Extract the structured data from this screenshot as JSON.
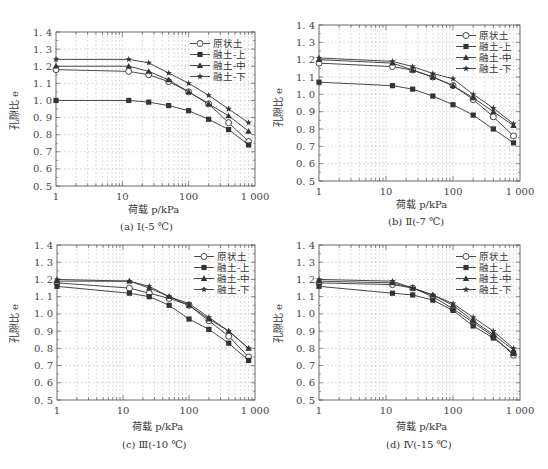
{
  "figure": {
    "panels": [
      {
        "id": "a",
        "caption": "(a) Ⅰ(-5 ℃)",
        "xlabel": "荷载 p/kPa",
        "ylabel": "孔隙比 e"
      },
      {
        "id": "b",
        "caption": "(b) Ⅱ(-7 ℃)",
        "xlabel": "荷载 p/kPa",
        "ylabel": "孔隙比 e"
      },
      {
        "id": "c",
        "caption": "(c) Ⅲ(-10 ℃)",
        "xlabel": "荷载 p/kPa",
        "ylabel": "孔隙比 e"
      },
      {
        "id": "d",
        "caption": "(d) Ⅳ(-15 ℃)",
        "xlabel": "荷载 p/kPa",
        "ylabel": "孔隙比 e"
      }
    ],
    "legend": [
      {
        "label": "原状土",
        "marker": "circle-open"
      },
      {
        "label": "融土-上",
        "marker": "square-filled"
      },
      {
        "label": "融土-中",
        "marker": "triangle-filled"
      },
      {
        "label": "融土-下",
        "marker": "star-filled"
      }
    ],
    "colors": {
      "line": "#333333",
      "grid": "#bbbbbb",
      "axis": "#444444"
    }
  },
  "chart_data": [
    {
      "type": "line",
      "title": "(a) Ⅰ(-5 ℃)",
      "xlabel": "荷载 p/kPa",
      "ylabel": "孔隙比 e",
      "xscale": "log",
      "xlim": [
        1,
        1000
      ],
      "ylim": [
        0.5,
        1.4
      ],
      "xticks": [
        "1",
        "10",
        "100",
        "1 000"
      ],
      "yticks": [
        "0.5",
        "0.6",
        "0.7",
        "0.8",
        "0.9",
        "1.0",
        "1.1",
        "1.2",
        "1.3",
        "1.4"
      ],
      "grid": true,
      "legend_position": "upper right",
      "x": [
        1,
        12.5,
        25,
        50,
        100,
        200,
        400,
        800
      ],
      "series": [
        {
          "name": "原状土",
          "values": [
            1.18,
            1.17,
            1.15,
            1.11,
            1.05,
            0.98,
            0.87,
            0.76
          ]
        },
        {
          "name": "融土-上",
          "values": [
            1.0,
            1.0,
            0.99,
            0.97,
            0.94,
            0.89,
            0.83,
            0.74
          ]
        },
        {
          "name": "融土-中",
          "values": [
            1.2,
            1.2,
            1.17,
            1.12,
            1.05,
            0.98,
            0.91,
            0.82
          ]
        },
        {
          "name": "融土-下",
          "values": [
            1.24,
            1.24,
            1.22,
            1.16,
            1.1,
            1.03,
            0.95,
            0.87
          ]
        }
      ]
    },
    {
      "type": "line",
      "title": "(b) Ⅱ(-7 ℃)",
      "xlabel": "荷载 p/kPa",
      "ylabel": "孔隙比 e",
      "xscale": "log",
      "xlim": [
        1,
        1000
      ],
      "ylim": [
        0.5,
        1.4
      ],
      "xticks": [
        "1",
        "10",
        "100",
        "1 000"
      ],
      "yticks": [
        "0.5",
        "0.6",
        "0.7",
        "0.8",
        "0.9",
        "1.0",
        "1.1",
        "1.2",
        "1.3",
        "1.4"
      ],
      "grid": true,
      "legend_position": "upper right",
      "x": [
        1,
        12.5,
        25,
        50,
        100,
        200,
        400,
        800
      ],
      "series": [
        {
          "name": "原状土",
          "values": [
            1.18,
            1.16,
            1.14,
            1.1,
            1.05,
            0.97,
            0.87,
            0.76
          ]
        },
        {
          "name": "融土-上",
          "values": [
            1.07,
            1.05,
            1.03,
            0.99,
            0.94,
            0.88,
            0.8,
            0.72
          ]
        },
        {
          "name": "融土-中",
          "values": [
            1.2,
            1.18,
            1.14,
            1.1,
            1.05,
            0.98,
            0.9,
            0.82
          ]
        },
        {
          "name": "融土-下",
          "values": [
            1.21,
            1.19,
            1.16,
            1.12,
            1.09,
            1.0,
            0.92,
            0.83
          ]
        }
      ]
    },
    {
      "type": "line",
      "title": "(c) Ⅲ(-10 ℃)",
      "xlabel": "荷载 p/kPa",
      "ylabel": "孔隙比 e",
      "xscale": "log",
      "xlim": [
        1,
        1000
      ],
      "ylim": [
        0.5,
        1.4
      ],
      "xticks": [
        "1",
        "10",
        "100",
        "1 000"
      ],
      "yticks": [
        "0.5",
        "0.6",
        "0.7",
        "0.8",
        "0.9",
        "1.0",
        "1.1",
        "1.2",
        "1.3",
        "1.4"
      ],
      "grid": true,
      "legend_position": "upper right",
      "x": [
        1,
        12.5,
        25,
        50,
        100,
        200,
        400,
        800
      ],
      "series": [
        {
          "name": "原状土",
          "values": [
            1.18,
            1.15,
            1.12,
            1.09,
            1.05,
            0.96,
            0.87,
            0.75
          ]
        },
        {
          "name": "融土-上",
          "values": [
            1.16,
            1.12,
            1.1,
            1.05,
            0.97,
            0.91,
            0.83,
            0.73
          ]
        },
        {
          "name": "融土-中",
          "values": [
            1.19,
            1.19,
            1.15,
            1.1,
            1.05,
            0.97,
            0.9,
            0.8
          ]
        },
        {
          "name": "融土-下",
          "values": [
            1.2,
            1.19,
            1.16,
            1.1,
            1.06,
            0.98,
            0.9,
            0.8
          ]
        }
      ]
    },
    {
      "type": "line",
      "title": "(d) Ⅳ(-15 ℃)",
      "xlabel": "荷载 p/kPa",
      "ylabel": "孔隙比 e",
      "xscale": "log",
      "xlim": [
        1,
        1000
      ],
      "ylim": [
        0.5,
        1.4
      ],
      "xticks": [
        "1",
        "10",
        "100",
        "1 000"
      ],
      "yticks": [
        "0.5",
        "0.6",
        "0.7",
        "0.8",
        "0.9",
        "1.0",
        "1.1",
        "1.2",
        "1.3",
        "1.4"
      ],
      "grid": true,
      "legend_position": "upper right",
      "x": [
        1,
        12.5,
        25,
        50,
        100,
        200,
        400,
        800
      ],
      "series": [
        {
          "name": "原状土",
          "values": [
            1.18,
            1.17,
            1.15,
            1.1,
            1.03,
            0.95,
            0.87,
            0.76
          ]
        },
        {
          "name": "融土-上",
          "values": [
            1.16,
            1.12,
            1.11,
            1.08,
            1.02,
            0.93,
            0.86,
            0.77
          ]
        },
        {
          "name": "融土-中",
          "values": [
            1.19,
            1.18,
            1.15,
            1.11,
            1.05,
            0.96,
            0.88,
            0.79
          ]
        },
        {
          "name": "融土-下",
          "values": [
            1.2,
            1.19,
            1.15,
            1.11,
            1.06,
            0.98,
            0.9,
            0.8
          ]
        }
      ]
    }
  ]
}
